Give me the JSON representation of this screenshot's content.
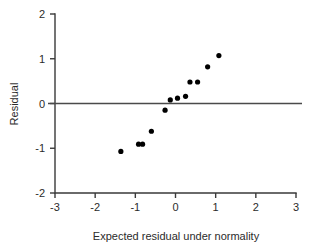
{
  "chart_data": {
    "type": "scatter",
    "title": "",
    "xlabel": "Expected residual under normality",
    "ylabel": "Residual",
    "xlim": [
      -3,
      3
    ],
    "ylim": [
      -2,
      2
    ],
    "xticks": [
      "-3",
      "-2",
      "-1",
      "0",
      "1",
      "2",
      "3"
    ],
    "xtick_values": [
      -3,
      -2,
      -1,
      0,
      1,
      2,
      3
    ],
    "yticks": [
      "2",
      "1",
      "0",
      "-1",
      "-2"
    ],
    "ytick_values": [
      2,
      1,
      0,
      -1,
      -2
    ],
    "grid": false,
    "legend": null,
    "reference_line": {
      "type": "horizontal",
      "y": 0,
      "label": "zero-residual-line"
    },
    "series": [
      {
        "name": "Residuals",
        "marker": "filled-circle",
        "color": "#000000",
        "x": [
          -1.36,
          -0.92,
          -0.82,
          -0.6,
          -0.26,
          -0.13,
          0.05,
          0.25,
          0.36,
          0.55,
          0.8,
          1.08
        ],
        "y": [
          -1.07,
          -0.91,
          -0.91,
          -0.62,
          -0.15,
          0.08,
          0.12,
          0.16,
          0.48,
          0.48,
          0.82,
          1.07
        ]
      }
    ]
  }
}
